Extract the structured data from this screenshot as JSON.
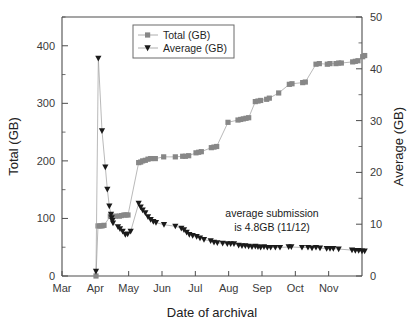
{
  "chart_data": {
    "type": "scatter",
    "title": "",
    "xlabel": "Date of archival",
    "ylabel": "Total (GB)",
    "y2label": "Average (GB)",
    "grid": false,
    "legend_position": "top-center",
    "xtick_labels": [
      "Mar",
      "Apr",
      "May",
      "Jun",
      "Jul",
      "Aug",
      "Sep",
      "Oct",
      "Nov"
    ],
    "ytick_labels": [
      "0",
      "100",
      "200",
      "300",
      "400"
    ],
    "ytick_values": [
      0,
      100,
      200,
      300,
      400
    ],
    "ylim": [
      0,
      450
    ],
    "y2tick_labels": [
      "0",
      "10",
      "20",
      "30",
      "40",
      "50"
    ],
    "y2tick_values": [
      0,
      10,
      20,
      30,
      40,
      50
    ],
    "y2lim": [
      0,
      50
    ],
    "xlim": [
      0,
      9
    ],
    "annotations": [
      {
        "name": "average-submission-note",
        "line1": "average submission",
        "line2": "is 4.8GB (11/12)"
      }
    ],
    "series": [
      {
        "name": "Total (GB)",
        "axis": "left",
        "marker": "square",
        "color": "#878787",
        "points": [
          [
            1.02,
            0
          ],
          [
            1.08,
            87
          ],
          [
            1.14,
            87
          ],
          [
            1.2,
            87
          ],
          [
            1.26,
            88
          ],
          [
            1.45,
            104
          ],
          [
            1.6,
            104
          ],
          [
            1.72,
            104
          ],
          [
            1.78,
            105
          ],
          [
            1.86,
            106
          ],
          [
            1.92,
            106
          ],
          [
            1.98,
            106
          ],
          [
            2.3,
            197
          ],
          [
            2.36,
            198
          ],
          [
            2.42,
            200
          ],
          [
            2.5,
            201
          ],
          [
            2.58,
            203
          ],
          [
            2.66,
            204
          ],
          [
            2.8,
            204
          ],
          [
            3.05,
            207
          ],
          [
            3.4,
            207
          ],
          [
            3.62,
            208
          ],
          [
            3.7,
            208
          ],
          [
            3.8,
            209
          ],
          [
            4.02,
            214
          ],
          [
            4.1,
            215
          ],
          [
            4.18,
            216
          ],
          [
            4.48,
            223
          ],
          [
            4.56,
            224
          ],
          [
            4.64,
            225
          ],
          [
            4.98,
            267
          ],
          [
            5.28,
            271
          ],
          [
            5.36,
            272
          ],
          [
            5.44,
            273
          ],
          [
            5.52,
            274
          ],
          [
            5.6,
            275
          ],
          [
            5.8,
            303
          ],
          [
            5.88,
            304
          ],
          [
            5.96,
            305
          ],
          [
            6.14,
            307
          ],
          [
            6.22,
            309
          ],
          [
            6.5,
            318
          ],
          [
            6.82,
            333
          ],
          [
            6.9,
            334
          ],
          [
            7.22,
            336
          ],
          [
            7.3,
            337
          ],
          [
            7.62,
            368
          ],
          [
            7.72,
            369
          ],
          [
            7.96,
            368
          ],
          [
            8.04,
            369
          ],
          [
            8.22,
            369
          ],
          [
            8.3,
            370
          ],
          [
            8.38,
            370
          ],
          [
            8.72,
            372
          ],
          [
            8.8,
            373
          ],
          [
            8.88,
            374
          ],
          [
            9.02,
            381
          ],
          [
            9.08,
            383
          ]
        ]
      },
      {
        "name": "Average (GB)",
        "axis": "right",
        "marker": "triangle-down",
        "color": "#1a1a1a",
        "points": [
          [
            1.02,
            0.9
          ],
          [
            1.09,
            42.0
          ],
          [
            1.2,
            28.0
          ],
          [
            1.3,
            21.0
          ],
          [
            1.36,
            16.7
          ],
          [
            1.42,
            13.5
          ],
          [
            1.47,
            11.9
          ],
          [
            1.49,
            11.2
          ],
          [
            1.51,
            10.7
          ],
          [
            1.53,
            10.2
          ],
          [
            1.68,
            9.5
          ],
          [
            1.74,
            9.1
          ],
          [
            1.82,
            8.6
          ],
          [
            1.9,
            8.0
          ],
          [
            1.97,
            8.1
          ],
          [
            2.06,
            8.6
          ],
          [
            2.3,
            14.0
          ],
          [
            2.36,
            13.3
          ],
          [
            2.42,
            12.7
          ],
          [
            2.5,
            12.2
          ],
          [
            2.58,
            11.4
          ],
          [
            2.66,
            10.9
          ],
          [
            2.74,
            10.5
          ],
          [
            2.82,
            10.3
          ],
          [
            3.06,
            9.9
          ],
          [
            3.4,
            9.6
          ],
          [
            3.58,
            9.2
          ],
          [
            3.66,
            8.9
          ],
          [
            3.74,
            8.4
          ],
          [
            3.82,
            8.0
          ],
          [
            3.92,
            7.8
          ],
          [
            4.04,
            7.6
          ],
          [
            4.14,
            7.3
          ],
          [
            4.26,
            7.0
          ],
          [
            4.46,
            6.8
          ],
          [
            4.56,
            6.5
          ],
          [
            4.66,
            6.4
          ],
          [
            4.82,
            6.3
          ],
          [
            4.96,
            6.2
          ],
          [
            5.06,
            6.2
          ],
          [
            5.16,
            6.2
          ],
          [
            5.3,
            5.9
          ],
          [
            5.4,
            5.8
          ],
          [
            5.5,
            5.8
          ],
          [
            5.6,
            5.7
          ],
          [
            5.7,
            5.6
          ],
          [
            5.8,
            5.7
          ],
          [
            5.88,
            5.6
          ],
          [
            5.96,
            5.5
          ],
          [
            6.06,
            5.6
          ],
          [
            6.16,
            5.5
          ],
          [
            6.26,
            5.5
          ],
          [
            6.4,
            5.5
          ],
          [
            6.54,
            5.5
          ],
          [
            6.8,
            5.6
          ],
          [
            6.88,
            5.6
          ],
          [
            7.2,
            5.5
          ],
          [
            7.38,
            5.5
          ],
          [
            7.5,
            5.4
          ],
          [
            7.62,
            5.5
          ],
          [
            7.74,
            5.4
          ],
          [
            7.94,
            5.3
          ],
          [
            8.04,
            5.3
          ],
          [
            8.14,
            5.3
          ],
          [
            8.3,
            5.2
          ],
          [
            8.7,
            5.0
          ],
          [
            8.8,
            4.9
          ],
          [
            8.9,
            4.9
          ],
          [
            9.0,
            4.8
          ],
          [
            9.08,
            4.8
          ]
        ]
      }
    ]
  },
  "legend": {
    "items": [
      {
        "label": "Total (GB)",
        "marker": "square-marker-icon"
      },
      {
        "label": "Average (GB)",
        "marker": "triangle-marker-icon"
      }
    ]
  }
}
